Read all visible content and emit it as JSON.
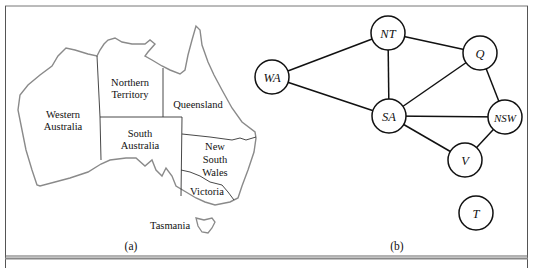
{
  "figure": {
    "panel_a": {
      "caption": "(a)",
      "regions": [
        {
          "id": "wa",
          "label_lines": [
            "Western",
            "Australia"
          ]
        },
        {
          "id": "nt",
          "label_lines": [
            "Northern",
            "Territory"
          ]
        },
        {
          "id": "q",
          "label_lines": [
            "Queensland"
          ]
        },
        {
          "id": "sa",
          "label_lines": [
            "South",
            "Australia"
          ]
        },
        {
          "id": "nsw",
          "label_lines": [
            "New",
            "South",
            "Wales"
          ]
        },
        {
          "id": "v",
          "label_lines": [
            "Victoria"
          ]
        },
        {
          "id": "t",
          "label_lines": [
            "Tasmania"
          ]
        }
      ]
    },
    "panel_b": {
      "caption": "(b)",
      "nodes": [
        {
          "id": "NT",
          "label": "NT"
        },
        {
          "id": "WA",
          "label": "WA"
        },
        {
          "id": "Q",
          "label": "Q"
        },
        {
          "id": "SA",
          "label": "SA"
        },
        {
          "id": "NSW",
          "label": "NSW"
        },
        {
          "id": "V",
          "label": "V"
        },
        {
          "id": "T",
          "label": "T"
        }
      ],
      "edges": [
        [
          "WA",
          "NT"
        ],
        [
          "WA",
          "SA"
        ],
        [
          "NT",
          "SA"
        ],
        [
          "NT",
          "Q"
        ],
        [
          "SA",
          "Q"
        ],
        [
          "SA",
          "NSW"
        ],
        [
          "SA",
          "V"
        ],
        [
          "Q",
          "NSW"
        ],
        [
          "NSW",
          "V"
        ]
      ]
    }
  }
}
